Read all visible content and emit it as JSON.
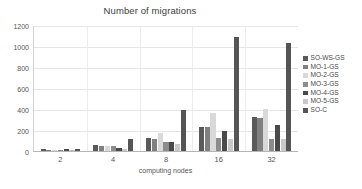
{
  "chart_data": {
    "type": "bar",
    "title": "Number of migrations",
    "xlabel": "computing nodes",
    "ylabel": "",
    "categories": [
      "2",
      "4",
      "8",
      "16",
      "32"
    ],
    "ylim": [
      0,
      1200
    ],
    "yticks": [
      0,
      200,
      400,
      600,
      800,
      1000,
      1200
    ],
    "grid": true,
    "legend_position": "right",
    "series": [
      {
        "name": "SO-WS-GS",
        "color": "#5a5a5a",
        "values": [
          18,
          60,
          120,
          232,
          320
        ]
      },
      {
        "name": "MO-1-GS",
        "color": "#808080",
        "values": [
          14,
          48,
          112,
          228,
          315
        ]
      },
      {
        "name": "MO-2-GS",
        "color": "#d9d9d9",
        "values": [
          10,
          52,
          170,
          365,
          400
        ]
      },
      {
        "name": "MO-3-GS",
        "color": "#8c8c8c",
        "values": [
          12,
          46,
          82,
          128,
          115
        ]
      },
      {
        "name": "MO-4-GS",
        "color": "#4a4a4a",
        "values": [
          16,
          28,
          88,
          188,
          252
        ]
      },
      {
        "name": "MO-5-GS",
        "color": "#c9c9c9",
        "values": [
          8,
          22,
          68,
          118,
          112
        ]
      },
      {
        "name": "SO-C",
        "color": "#555555",
        "values": [
          20,
          118,
          395,
          1085,
          1030
        ]
      }
    ]
  },
  "legend": {
    "items": [
      {
        "label": "SO-WS-GS"
      },
      {
        "label": "MO-1-GS"
      },
      {
        "label": "MO-2-GS"
      },
      {
        "label": "MO-3-GS"
      },
      {
        "label": "MO-4-GS"
      },
      {
        "label": "MO-5-GS"
      },
      {
        "label": "SO-C"
      }
    ]
  }
}
